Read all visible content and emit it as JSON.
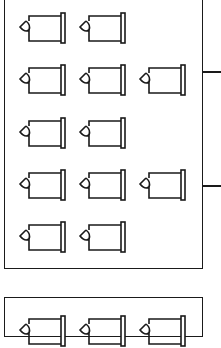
{
  "diagram": {
    "stroke_color": "#1a1a1a",
    "background": "#ffffff",
    "icon_type": "trash-bin-sideways-icon",
    "groups": [
      {
        "name": "group-1",
        "rows": [
          {
            "count": 2
          },
          {
            "count": 3
          },
          {
            "count": 2
          },
          {
            "count": 3
          },
          {
            "count": 2
          }
        ],
        "connectors": 2
      },
      {
        "name": "group-2",
        "rows": [
          {
            "count": 3
          }
        ],
        "connectors": 0
      }
    ]
  }
}
